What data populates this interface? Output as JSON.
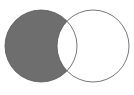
{
  "figure": {
    "title": "Venn diagram",
    "width": 134,
    "height": 95,
    "background_color": "#ffffff"
  },
  "colors": {
    "background": "#ffffff",
    "shaded_fill": "#6e6e6e",
    "unshaded_fill": "#ffffff",
    "outline": "#555555"
  },
  "chart_data": {
    "type": "venn",
    "title": "Venn diagram",
    "set_count": 2,
    "highlighted_region": "A-only",
    "highlighted_region_label": "A \\ B (set difference)",
    "grid": false,
    "legend": "none",
    "sets": [
      {
        "id": "A",
        "position": "left",
        "cx": 41,
        "cy": 46,
        "r": 36,
        "fill": "#6e6e6e",
        "stroke": "#555555",
        "stroke_width": 0.8,
        "shaded": true
      },
      {
        "id": "B",
        "position": "right",
        "cx": 93,
        "cy": 46,
        "r": 36,
        "fill": "#ffffff",
        "stroke": "#555555",
        "stroke_width": 0.8,
        "shaded": false
      }
    ],
    "regions": [
      {
        "id": "A-only",
        "label": "A only",
        "shaded": true,
        "fill": "#6e6e6e"
      },
      {
        "id": "A-and-B",
        "label": "A intersect B",
        "shaded": false,
        "fill": "#ffffff"
      },
      {
        "id": "B-only",
        "label": "B only",
        "shaded": false,
        "fill": "#ffffff"
      }
    ],
    "annotations": [],
    "tick_labels": [],
    "xlabel": "",
    "ylabel": ""
  }
}
